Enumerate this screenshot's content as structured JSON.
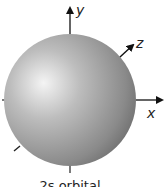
{
  "diagram": {
    "axes": {
      "x_label": "x",
      "y_label": "y",
      "z_label": "z"
    },
    "caption": "2s orbital",
    "colors": {
      "sphere_light": "#f2f2f2",
      "sphere_mid": "#b4b4b4",
      "sphere_dark": "#6e6e6e",
      "axis": "#111111"
    }
  }
}
